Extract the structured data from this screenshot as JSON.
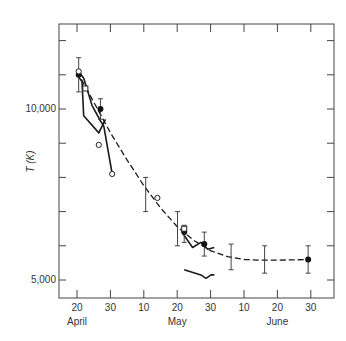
{
  "chart_data": {
    "type": "scatter",
    "title": "",
    "xlabel": "Date (April – June)",
    "ylabel": "T (K)",
    "ylim": [
      4500,
      12500
    ],
    "grid": false,
    "legend": null,
    "x_tick_labels": [
      "20",
      "30",
      "10",
      "20",
      "30",
      "10",
      "20",
      "30"
    ],
    "x_month_labels": [
      {
        "label": "April",
        "under_tick": 0
      },
      {
        "label": "May",
        "under_tick": 3
      },
      {
        "label": "June",
        "under_tick": 6
      }
    ],
    "y_tick_labels": [
      {
        "value": 10000,
        "label": "10,000"
      },
      {
        "value": 5000,
        "label": "5,000"
      }
    ],
    "y_minor_ticks": [
      12000,
      11000,
      10000,
      9000,
      8000,
      7000,
      6000,
      5000
    ],
    "series": [
      {
        "name": "filled circles",
        "marker": "filled-circle",
        "points": [
          {
            "date": "Apr 20",
            "day": 0.5,
            "T": 11000,
            "err_low": 10500,
            "err_high": 11500
          },
          {
            "date": "Apr 27",
            "day": 7,
            "T": 10000,
            "err_low": 9700,
            "err_high": 10300
          },
          {
            "date": "May 22",
            "day": 32,
            "T": 6400,
            "err_low": 6100,
            "err_high": 6600
          },
          {
            "date": "May 28",
            "day": 38,
            "T": 6050,
            "err_low": 5700,
            "err_high": 6400
          },
          {
            "date": "June 28",
            "day": 69,
            "T": 5600,
            "err_low": 5200,
            "err_high": 6000
          }
        ]
      },
      {
        "name": "open circles",
        "marker": "open-circle",
        "points": [
          {
            "date": "Apr 20",
            "day": 0.5,
            "T": 11100
          },
          {
            "date": "Apr 26",
            "day": 6.5,
            "T": 8950
          },
          {
            "date": "Apr 30",
            "day": 10.5,
            "T": 8100
          },
          {
            "date": "May 13",
            "day": 24,
            "T": 7400
          }
        ]
      },
      {
        "name": "open squares",
        "marker": "open-square",
        "points": [
          {
            "date": "Apr 22",
            "day": 2.5,
            "T": 10600
          },
          {
            "date": "May 22",
            "day": 32,
            "T": 6500
          }
        ]
      },
      {
        "name": "error bars (fit points)",
        "marker": "errorbar",
        "points": [
          {
            "date": "May 10",
            "day": 20.5,
            "T": 7500,
            "err_low": 7000,
            "err_high": 8000
          },
          {
            "date": "May 20",
            "day": 30,
            "T": 6500,
            "err_low": 6000,
            "err_high": 7000
          },
          {
            "date": "June 5",
            "day": 46,
            "T": 5700,
            "err_low": 5300,
            "err_high": 6050
          },
          {
            "date": "June 15",
            "day": 56,
            "T": 5600,
            "err_low": 5200,
            "err_high": 6000
          }
        ]
      },
      {
        "name": "dashed fit curve",
        "style": "dashed",
        "points": [
          {
            "day": 0,
            "T": 11100
          },
          {
            "day": 5,
            "T": 10200
          },
          {
            "day": 10,
            "T": 9300
          },
          {
            "day": 15,
            "T": 8500
          },
          {
            "day": 20,
            "T": 7750
          },
          {
            "day": 25,
            "T": 7100
          },
          {
            "day": 30,
            "T": 6550
          },
          {
            "day": 35,
            "T": 6150
          },
          {
            "day": 40,
            "T": 5850
          },
          {
            "day": 45,
            "T": 5680
          },
          {
            "day": 50,
            "T": 5600
          },
          {
            "day": 55,
            "T": 5580
          },
          {
            "day": 60,
            "T": 5580
          },
          {
            "day": 69,
            "T": 5600
          }
        ]
      },
      {
        "name": "solid curve A",
        "style": "solid",
        "points": [
          {
            "day": 0.5,
            "T": 11100
          },
          {
            "day": 2,
            "T": 10900
          },
          {
            "day": 4.5,
            "T": 10100
          },
          {
            "day": 7,
            "T": 9650
          },
          {
            "day": 8,
            "T": 9500
          },
          {
            "day": 10.5,
            "T": 8100
          }
        ]
      },
      {
        "name": "solid curve B",
        "style": "solid",
        "points": [
          {
            "day": 0,
            "T": 11000
          },
          {
            "day": 1.5,
            "T": 10800
          },
          {
            "day": 2,
            "T": 9800
          },
          {
            "day": 6.5,
            "T": 9300
          },
          {
            "day": 8,
            "T": 9600
          },
          {
            "day": 8.5,
            "T": 9700
          }
        ]
      },
      {
        "name": "solid curve C (late May)",
        "style": "solid",
        "points": [
          {
            "day": 31.5,
            "T": 6500
          },
          {
            "day": 32,
            "T": 6300
          },
          {
            "day": 34.5,
            "T": 5950
          },
          {
            "day": 37,
            "T": 6100
          },
          {
            "day": 39,
            "T": 5900
          },
          {
            "day": 41,
            "T": 5950
          }
        ]
      },
      {
        "name": "solid curve D (short)",
        "style": "solid",
        "points": [
          {
            "day": 32,
            "T": 5300
          },
          {
            "day": 37,
            "T": 5150
          },
          {
            "day": 38.5,
            "T": 5050
          },
          {
            "day": 40,
            "T": 5150
          },
          {
            "day": 41,
            "T": 5150
          }
        ]
      }
    ]
  }
}
